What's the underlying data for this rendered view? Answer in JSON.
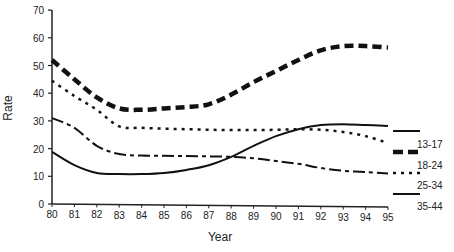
{
  "chart_data": {
    "type": "line",
    "title": "",
    "xlabel": "Year",
    "ylabel": "Rate",
    "ylim": [
      0,
      70
    ],
    "yticks": [
      0,
      10,
      20,
      30,
      40,
      50,
      60,
      70
    ],
    "x": [
      "80",
      "81",
      "82",
      "83",
      "84",
      "85",
      "86",
      "87",
      "88",
      "89",
      "90",
      "91",
      "92",
      "93",
      "94",
      "95"
    ],
    "grid": false,
    "legend_position": "right",
    "series": [
      {
        "name": "13-17",
        "style": "solid",
        "values": [
          18.8,
          14,
          11.2,
          10.8,
          10.8,
          11.2,
          12.3,
          14,
          17,
          21,
          24.5,
          27,
          28.5,
          28.8,
          28.5,
          28.2
        ]
      },
      {
        "name": "18-24",
        "style": "heavy-dash",
        "values": [
          52,
          45,
          38.5,
          34.5,
          34,
          34.5,
          35,
          36,
          39.5,
          44,
          48,
          52,
          55.5,
          57,
          57,
          56.5
        ]
      },
      {
        "name": "25-34",
        "style": "dotted",
        "values": [
          44.5,
          39,
          34,
          28,
          27.5,
          27.2,
          27,
          26.8,
          26.7,
          26.7,
          26.8,
          27,
          26.8,
          26,
          24.5,
          22
        ]
      },
      {
        "name": "35-44",
        "style": "dash-dot",
        "values": [
          31,
          27.5,
          21,
          18,
          17.5,
          17.4,
          17.3,
          17.2,
          17,
          16.5,
          15.5,
          14.5,
          13,
          12,
          11.5,
          11
        ]
      }
    ]
  },
  "legend": {
    "items": [
      "13-17",
      "18-24",
      "25-34",
      "35-44"
    ]
  }
}
